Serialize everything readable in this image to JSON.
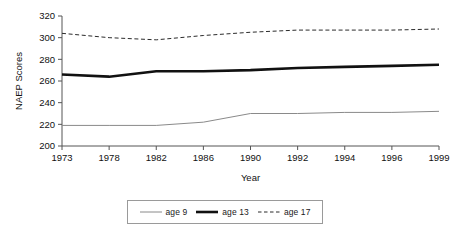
{
  "chart_data": {
    "type": "line",
    "title": "",
    "subtitle": "",
    "xlabel": "Year",
    "ylabel": "NAEP Scores",
    "categories": [
      "1973",
      "1978",
      "1982",
      "1986",
      "1990",
      "1992",
      "1994",
      "1996",
      "1999"
    ],
    "ylim": [
      200,
      320
    ],
    "yticks": [
      200,
      220,
      240,
      260,
      280,
      300,
      320
    ],
    "grid": false,
    "legend_position": "bottom",
    "series": [
      {
        "name": "age 9",
        "values": [
          219,
          219,
          219,
          222,
          230,
          230,
          231,
          231,
          232
        ],
        "color": "#8a8a8a",
        "style": "solid",
        "width": 1
      },
      {
        "name": "age 13",
        "values": [
          266,
          264,
          269,
          269,
          270,
          272,
          273,
          274,
          275
        ],
        "color": "#111111",
        "style": "solid",
        "width": 2.6
      },
      {
        "name": "age 17",
        "values": [
          304,
          300,
          298,
          302,
          305,
          307,
          307,
          307,
          308
        ],
        "color": "#2b2b2b",
        "style": "dashed",
        "width": 1
      }
    ]
  },
  "axes": {
    "y_tick_labels": [
      "320",
      "300",
      "280",
      "260",
      "240",
      "220",
      "200"
    ],
    "x_tick_labels": [
      "1973",
      "1978",
      "1982",
      "1986",
      "1990",
      "1992",
      "1994",
      "1996",
      "1999"
    ],
    "y_title": "NAEP Scores",
    "x_title": "Year",
    "axis_color": "#555555"
  },
  "legend": {
    "entries": [
      {
        "label": "age 9",
        "icon": "thin-gray-line-icon"
      },
      {
        "label": "age 13",
        "icon": "thick-black-line-icon"
      },
      {
        "label": "age 17",
        "icon": "dashed-line-icon"
      }
    ]
  }
}
